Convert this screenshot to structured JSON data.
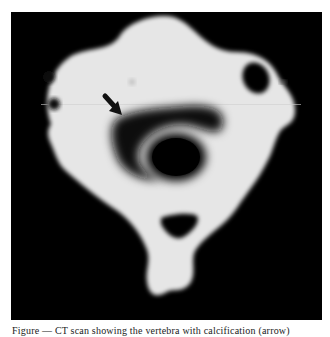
{
  "figure": {
    "type": "axial CT scan of cervical vertebra",
    "background_color": "#000000",
    "bone_color": "#e8e8e8",
    "annotations": [
      {
        "type": "arrow",
        "icon": "arrow-down-right-icon",
        "color": "#111111"
      }
    ]
  },
  "caption": {
    "text": "Figure — CT scan showing the vertebra with calcification (arrow)"
  }
}
